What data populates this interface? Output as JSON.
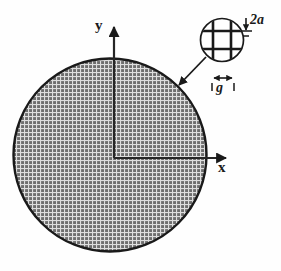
{
  "figure": {
    "background_color": "#fefefe",
    "stroke_color": "#1a1a1a",
    "mesh_fill_color": "#707070",
    "mesh_line_color": "#d8d8d8"
  },
  "axes": {
    "x_label": "x",
    "y_label": "y",
    "origin": {
      "x": 114,
      "y": 158
    }
  },
  "disk": {
    "center_x": 110,
    "center_y": 155,
    "radius": 97,
    "fill": "mesh-hatch",
    "outline_width": 2
  },
  "detail_callout": {
    "name": "mesh-detail-circle",
    "center_x": 222,
    "center_y": 40,
    "radius": 22,
    "bar_count_horizontal": 2,
    "bar_count_vertical": 2
  },
  "dimensions": [
    {
      "name": "aperture-height",
      "label": "2a",
      "orientation": "vertical",
      "icon": "dimension-arrow-vertical"
    },
    {
      "name": "bar-width",
      "label": "g",
      "orientation": "horizontal",
      "icon": "dimension-arrow-horizontal"
    }
  ],
  "leader": {
    "name": "leader-arrow",
    "from_x": 205,
    "from_y": 58,
    "to_x": 180,
    "to_y": 84,
    "icon": "arrow-down-left"
  }
}
